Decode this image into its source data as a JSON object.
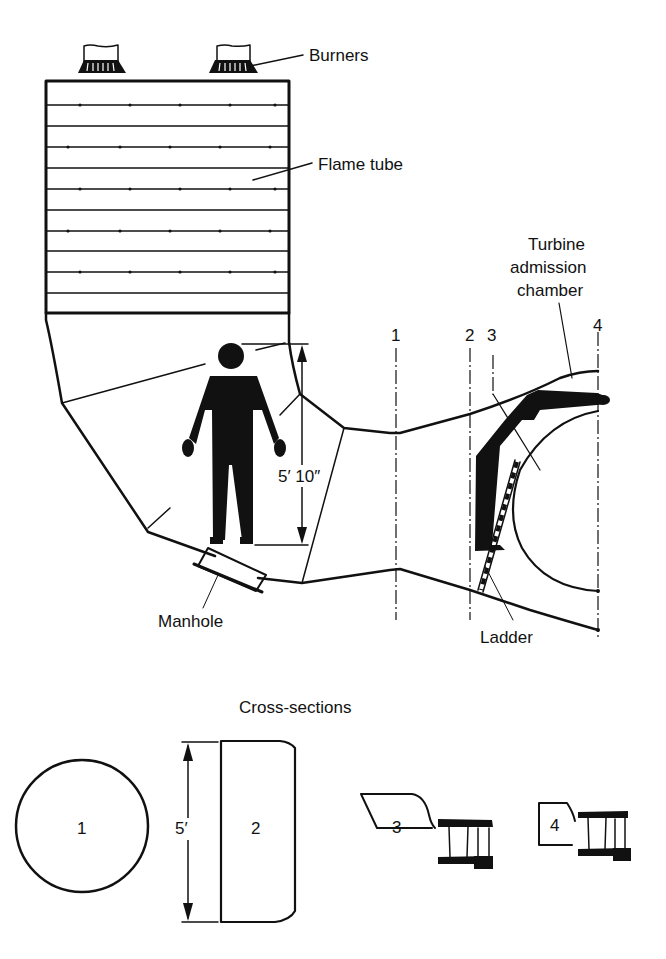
{
  "diagram": {
    "labels": {
      "burners": "Burners",
      "flame_tube": "Flame tube",
      "turbine_line1": "Turbine",
      "turbine_line2": "admission",
      "turbine_line3": "chamber",
      "manhole": "Manhole",
      "ladder": "Ladder",
      "height_dim": "5′ 10″",
      "cross_sections_title": "Cross-sections",
      "section_height_dim": "5′"
    },
    "section_markers": [
      "1",
      "2",
      "3",
      "4"
    ],
    "cross_sections": [
      {
        "id": "1",
        "shape": "circle"
      },
      {
        "id": "2",
        "shape": "rounded-rectangle"
      },
      {
        "id": "3",
        "shape": "trapezoid-with-turbine"
      },
      {
        "id": "4",
        "shape": "square-with-turbine"
      }
    ]
  }
}
